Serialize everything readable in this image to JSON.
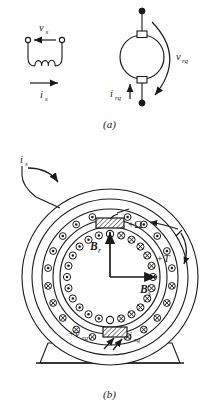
{
  "figure": {
    "panel_a": {
      "caption": "(a)",
      "stator_circuit": {
        "voltage_label": "v",
        "voltage_sub": "s",
        "current_label": "i",
        "current_sub": "s",
        "terminal_style": "open-circle",
        "coil_turns": 3,
        "voltage_arrow_direction": "left",
        "current_arrow_direction": "right"
      },
      "rotor_machine": {
        "voltage_label": "v",
        "voltage_sub": "rq",
        "current_label": "i",
        "current_sub": "rq",
        "terminal_style": "filled-dot",
        "brush_count": 2,
        "voltage_arrow_direction": "clockwise",
        "current_arrow_direction": "up"
      }
    },
    "panel_b": {
      "caption": "(b)",
      "stator_current_label": "i",
      "stator_current_sub": "s",
      "speed_label": "+Ω",
      "torque_label": "+T",
      "rotor_flux_label": "B",
      "rotor_flux_sub": "r",
      "stator_flux_label": "B",
      "stator_flux_sub": "s",
      "brush_voltage_label": "+v",
      "brush_voltage_sub": "rq",
      "brush_current_label": "i",
      "brush_current_sub": "rq",
      "stator_conductors": {
        "top_symbol": "dot",
        "bottom_symbol": "cross",
        "count": 22
      },
      "rotor_conductors": {
        "left_symbol": "dot",
        "right_symbol": "cross",
        "count": 24
      },
      "brushes": [
        {
          "position": "top",
          "fill": "hatched"
        },
        {
          "position": "bottom",
          "fill": "hatched"
        }
      ],
      "base": "pedestal-trapezoid"
    }
  },
  "colors": {
    "line": "#1a1a1a",
    "background": "#ffffff",
    "hatch": "#1a1a1a"
  }
}
